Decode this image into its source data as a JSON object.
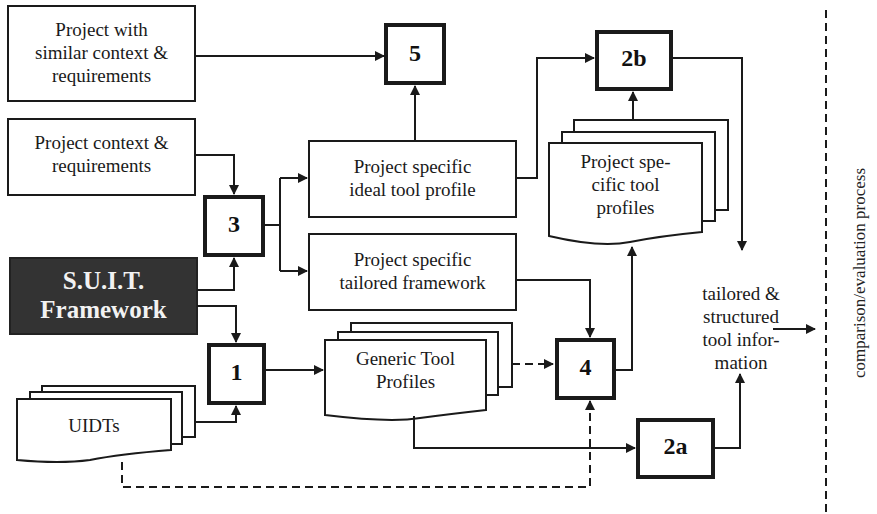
{
  "diagram": {
    "boxes": {
      "similar_project": "Project with similar context & requirements",
      "similar_project_lines": [
        "Project with",
        "similar context &",
        "requirements"
      ],
      "project_context_lines": [
        "Project context &",
        "requirements"
      ],
      "suit_framework_lines": [
        "S.U.I.T.",
        "Framework"
      ],
      "uidts": "UIDTs",
      "ideal_profile_lines": [
        "Project specific",
        "ideal tool profile"
      ],
      "tailored_framework_lines": [
        "Project specific",
        "tailored framework"
      ],
      "generic_profiles_lines": [
        "Generic Tool",
        "Profiles"
      ],
      "specific_profiles_lines": [
        "Project spe-",
        "cific tool",
        "profiles"
      ],
      "output_lines": [
        "tailored &",
        "structured",
        "tool infor-",
        "mation"
      ]
    },
    "steps": {
      "s1": "1",
      "s2a": "2a",
      "s2b": "2b",
      "s3": "3",
      "s4": "4",
      "s5": "5"
    },
    "side_label": "comparison/evaluation process",
    "colors": {
      "line": "#1a1a1a",
      "suit_fill": "#333333",
      "suit_text": "#f2f2f2",
      "background": "#ffffff"
    }
  }
}
